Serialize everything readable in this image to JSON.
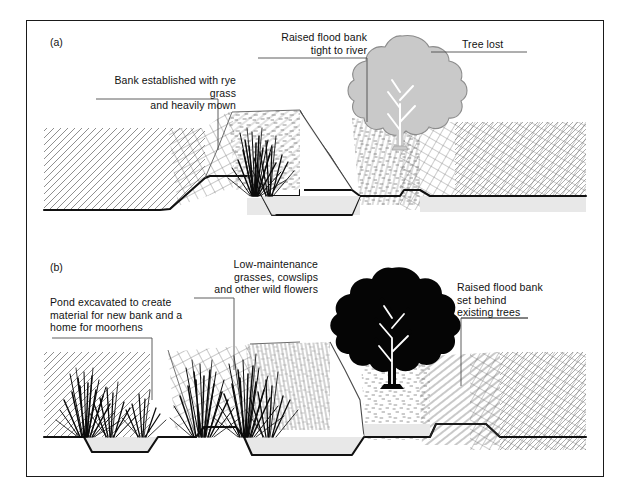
{
  "figure": {
    "panels": [
      {
        "tag": "(a)",
        "name": "existing-conventional-river-management",
        "labels": [
          {
            "name": "bank-established-rye-grass",
            "text": "Bank established with rye grass\nand heavily mown",
            "align": "right"
          },
          {
            "name": "raised-flood-bank-tight-to-river",
            "text": "Raised flood bank\ntight to river",
            "align": "right"
          },
          {
            "name": "tree-lost",
            "text": "Tree lost",
            "align": "left"
          }
        ],
        "features": {
          "tree_style": "ghosted-grey",
          "channel": "narrow-steep-sided",
          "reeds": "single-clump-left-bank",
          "water_present": true
        }
      },
      {
        "tag": "(b)",
        "name": "enhanced-river-restoration-scheme",
        "labels": [
          {
            "name": "pond-excavated",
            "text": "Pond excavated to create\nmaterial for new bank and a\nhome for moorhens",
            "align": "left"
          },
          {
            "name": "low-maintenance-grasses",
            "text": "Low-maintenance\ngrasses, cowslips\nand other wild flowers",
            "align": "right"
          },
          {
            "name": "raised-flood-bank-set-behind",
            "text": "Raised flood bank\nset behind\nexisting trees",
            "align": "left"
          }
        ],
        "features": {
          "tree_style": "solid-black",
          "channel": "wide-shallow-bermed",
          "pond_present": true,
          "reeds": "multiple-clumps-pond-and-bank",
          "water_present": true
        }
      }
    ],
    "colors": {
      "frame": "#1a1a1a",
      "ground_line": "#111111",
      "water_fill": "#e8e8e8",
      "hatch": "#555555",
      "ghost_tree": "#c9c9c9",
      "ghost_tree_outline": "#8c8c8c",
      "solid_tree": "#050505",
      "leader_line": "#4d4d4d",
      "text": "#121212",
      "background": "#ffffff"
    }
  }
}
